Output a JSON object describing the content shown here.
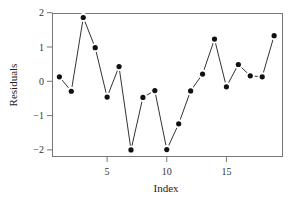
{
  "chart_data": {
    "type": "line",
    "title": "",
    "xlabel": "Index",
    "ylabel": "Residuals",
    "x": [
      1,
      2,
      3,
      4,
      5,
      6,
      7,
      8,
      9,
      10,
      11,
      12,
      13,
      14,
      15,
      16,
      17,
      18,
      19
    ],
    "series": [
      {
        "name": "Residuals",
        "values": [
          0.13,
          -0.29,
          1.86,
          0.98,
          -0.46,
          0.43,
          -2.0,
          -0.47,
          -0.27,
          -1.99,
          -1.24,
          -0.28,
          0.21,
          1.23,
          -0.16,
          0.49,
          0.16,
          0.13,
          1.33
        ],
        "marker": "filled-circle",
        "line": "solid"
      }
    ],
    "xlim": [
      0.4,
      19.6
    ],
    "ylim": [
      -2.18,
      2.0
    ],
    "xticks": [
      5,
      10,
      15
    ],
    "xtick_labels": [
      "5",
      "10",
      "15"
    ],
    "yticks": [
      -2,
      -1,
      0,
      1,
      2
    ],
    "ytick_labels": [
      "−2",
      "−1",
      "0",
      "1",
      "2"
    ],
    "grid": false,
    "legend": null,
    "colors": {
      "line": "#333333",
      "marker": "#111111",
      "axis": "#666666"
    }
  }
}
